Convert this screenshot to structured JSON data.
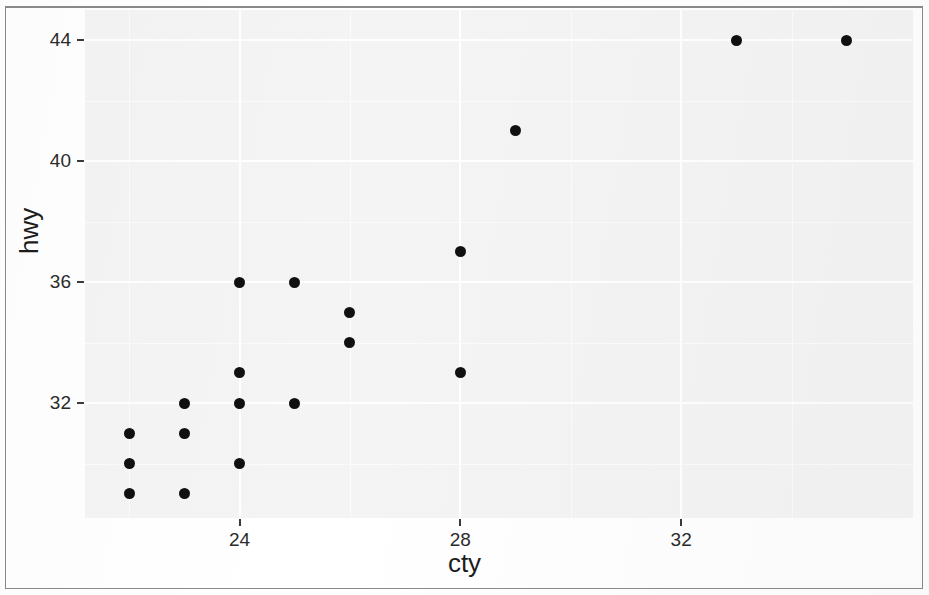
{
  "figure": {
    "width": 929,
    "height": 595,
    "background_color": "#ffffff",
    "panel_background_color": "#f4f4f4",
    "gridline_color": "#ffffff",
    "point_color": "#101010"
  },
  "axes": {
    "x_title": "cty",
    "y_title": "hwy",
    "x_tick_labels": [
      "24",
      "28",
      "32"
    ],
    "x_tick_values": [
      24,
      28,
      32
    ],
    "y_tick_labels": [
      "32",
      "36",
      "40",
      "44"
    ],
    "y_tick_values": [
      32,
      36,
      40,
      44
    ]
  },
  "chart_data": {
    "type": "scatter",
    "title": "",
    "xlabel": "cty",
    "ylabel": "hwy",
    "xlim": [
      21.2,
      36.2
    ],
    "ylim": [
      28.2,
      45.0
    ],
    "xticks": [
      24,
      28,
      32
    ],
    "yticks": [
      32,
      36,
      40,
      44
    ],
    "x_minor_ticks": [
      22,
      26,
      30,
      34
    ],
    "y_minor_ticks": [
      30,
      34,
      38,
      42
    ],
    "grid": true,
    "legend": "none",
    "marker": "filled-circle",
    "marker_color": "#101010",
    "marker_size_px": 11,
    "points": [
      {
        "cty": 22,
        "hwy": 31
      },
      {
        "cty": 22,
        "hwy": 30
      },
      {
        "cty": 22,
        "hwy": 29
      },
      {
        "cty": 23,
        "hwy": 32
      },
      {
        "cty": 23,
        "hwy": 31
      },
      {
        "cty": 23,
        "hwy": 29
      },
      {
        "cty": 24,
        "hwy": 36
      },
      {
        "cty": 24,
        "hwy": 33
      },
      {
        "cty": 24,
        "hwy": 32
      },
      {
        "cty": 24,
        "hwy": 30
      },
      {
        "cty": 25,
        "hwy": 36
      },
      {
        "cty": 25,
        "hwy": 32
      },
      {
        "cty": 26,
        "hwy": 35
      },
      {
        "cty": 26,
        "hwy": 34
      },
      {
        "cty": 28,
        "hwy": 37
      },
      {
        "cty": 28,
        "hwy": 33
      },
      {
        "cty": 29,
        "hwy": 41
      },
      {
        "cty": 33,
        "hwy": 44
      },
      {
        "cty": 35,
        "hwy": 44
      }
    ]
  }
}
